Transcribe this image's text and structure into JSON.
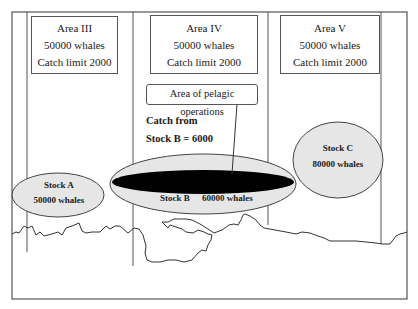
{
  "diagram": {
    "areas": [
      {
        "name": "Area III",
        "whales": "50000 whales",
        "catch_limit": "Catch limit 2000"
      },
      {
        "name": "Area IV",
        "whales": "50000 whales",
        "catch_limit": "Catch limit 2000"
      },
      {
        "name": "Area V",
        "whales": "50000 whales",
        "catch_limit": "Catch limit 2000"
      }
    ],
    "pelagic_label": "Area of pelagic operations",
    "catch_note": {
      "line1": "Catch from",
      "line2": "Stock B = 6000"
    },
    "stocks": [
      {
        "name": "Stock A",
        "whales": "50000 whales"
      },
      {
        "name": "Stock B",
        "whales": "60000 whales"
      },
      {
        "name": "Stock C",
        "whales": "80000 whales"
      }
    ],
    "colors": {
      "frame": "#555555",
      "stock_fill": "#e6e6e6",
      "pelagic_fill": "#000000",
      "coastline": "#333333"
    }
  }
}
